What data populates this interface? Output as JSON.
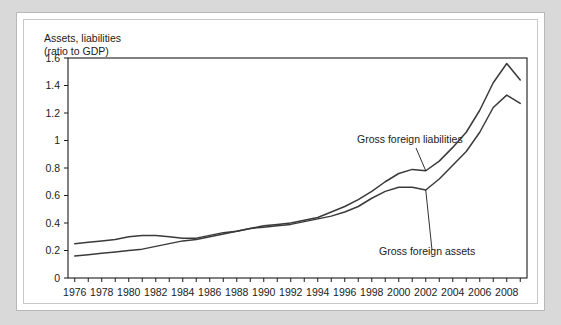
{
  "figure": {
    "axis_caption": "Assets, liabilities\n(ratio to GDP)"
  },
  "chart_data": {
    "type": "line",
    "title": "",
    "subtitle": "",
    "xlabel": "",
    "ylabel": "Assets, liabilities (ratio to GDP)",
    "xlim": [
      1975.5,
      2009.5
    ],
    "ylim": [
      0,
      1.6
    ],
    "ytick_labels": [
      "0",
      "0.2",
      "0.4",
      "0.6",
      "0.8",
      "1",
      "1.2",
      "1.4",
      "1.6"
    ],
    "ytick_values": [
      0,
      0.2,
      0.4,
      0.6,
      0.8,
      1.0,
      1.2,
      1.4,
      1.6
    ],
    "xtick_labels": [
      "1976",
      "1978",
      "1980",
      "1982",
      "1984",
      "1986",
      "1988",
      "1990",
      "1992",
      "1994",
      "1996",
      "1998",
      "2000",
      "2002",
      "2004",
      "2006",
      "2008"
    ],
    "xtick_values": [
      1976,
      1978,
      1980,
      1982,
      1984,
      1986,
      1988,
      1990,
      1992,
      1994,
      1996,
      1998,
      2000,
      2002,
      2004,
      2006,
      2008
    ],
    "minor_xticks_every": 1,
    "grid": false,
    "legend": "inline-annotations",
    "x": [
      1976,
      1977,
      1978,
      1979,
      1980,
      1981,
      1982,
      1983,
      1984,
      1985,
      1986,
      1987,
      1988,
      1989,
      1990,
      1991,
      1992,
      1993,
      1994,
      1995,
      1996,
      1997,
      1998,
      1999,
      2000,
      2001,
      2002,
      2003,
      2004,
      2005,
      2006,
      2007,
      2008,
      2009
    ],
    "series": [
      {
        "name": "Gross foreign liabilities",
        "color": "#3a3a3a",
        "values": [
          0.25,
          0.26,
          0.27,
          0.28,
          0.3,
          0.31,
          0.31,
          0.3,
          0.29,
          0.29,
          0.31,
          0.33,
          0.34,
          0.36,
          0.38,
          0.39,
          0.4,
          0.42,
          0.44,
          0.48,
          0.52,
          0.57,
          0.63,
          0.7,
          0.76,
          0.79,
          0.78,
          0.85,
          0.95,
          1.06,
          1.22,
          1.42,
          1.56,
          1.44
        ]
      },
      {
        "name": "Gross foreign assets",
        "color": "#3a3a3a",
        "values": [
          0.16,
          0.17,
          0.18,
          0.19,
          0.2,
          0.21,
          0.23,
          0.25,
          0.27,
          0.28,
          0.3,
          0.32,
          0.34,
          0.36,
          0.37,
          0.38,
          0.39,
          0.41,
          0.43,
          0.45,
          0.48,
          0.52,
          0.58,
          0.63,
          0.66,
          0.66,
          0.64,
          0.72,
          0.82,
          0.92,
          1.06,
          1.24,
          1.33,
          1.27
        ]
      }
    ],
    "annotations": [
      {
        "text": "Gross foreign liabilities",
        "target_series": "Gross foreign liabilities",
        "target_x": 2002
      },
      {
        "text": "Gross foreign assets",
        "target_series": "Gross foreign assets",
        "target_x": 2002
      }
    ]
  }
}
